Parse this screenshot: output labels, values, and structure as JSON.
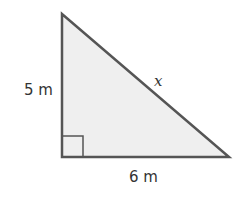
{
  "diagram": {
    "type": "right-triangle",
    "colors": {
      "fill": "#efefef",
      "stroke": "#555555",
      "text": "#333333"
    },
    "vertices": {
      "top": [
        62,
        14
      ],
      "right_angle": [
        62,
        157
      ],
      "right": [
        229,
        157
      ]
    },
    "labels": {
      "vertical_side": "5 m",
      "horizontal_side": "6 m",
      "hypotenuse": "x"
    }
  }
}
